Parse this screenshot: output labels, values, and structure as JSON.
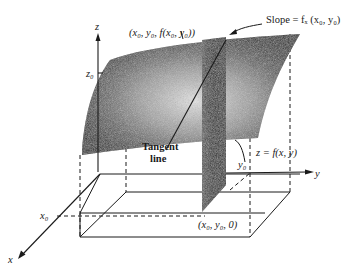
{
  "figure": {
    "type": "3d-surface-partial-derivative-diagram",
    "axes": {
      "x_label": "x",
      "y_label": "y",
      "z_label": "z"
    },
    "tick_labels": {
      "x0": "x₀",
      "y0": "y₀",
      "z0": "z₀"
    },
    "annotations": {
      "point_on_surface": "(x₀, y₀, f(x₀, y₀))",
      "slope": "Slope = fₓ (x₀, y₀)",
      "surface": "z = f(x, y)",
      "tangent_line_1": "Tangent",
      "tangent_line_2": "line",
      "base_point": "(x₀, y₀, 0)"
    },
    "colors": {
      "ink": "#1a1a1a",
      "surface_dark": "#111111",
      "surface_light": "#d8d8d8",
      "background": "#ffffff"
    }
  }
}
